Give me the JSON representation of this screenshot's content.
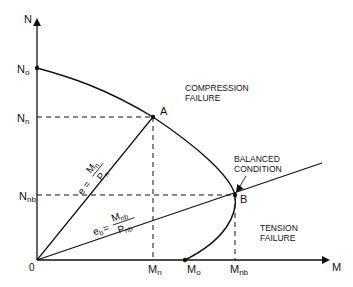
{
  "diagram": {
    "axes": {
      "y_label": "N",
      "x_label": "M",
      "origin_label": "0"
    },
    "y_ticks": {
      "n0": {
        "main": "N",
        "sub": "o"
      },
      "nn": {
        "main": "N",
        "sub": "n"
      },
      "nnb": {
        "main": "N",
        "sub": "nb"
      }
    },
    "x_ticks": {
      "mn": {
        "main": "M",
        "sub": "n"
      },
      "m0": {
        "main": "M",
        "sub": "o"
      },
      "mnb": {
        "main": "M",
        "sub": "nb"
      }
    },
    "points": {
      "a": "A",
      "b": "B"
    },
    "regions": {
      "compression_line1": "COMPRESSION",
      "compression_line2": "FAILURE",
      "tension_line1": "TENSION",
      "tension_line2": "FAILURE",
      "balanced_line1": "BALANCED",
      "balanced_line2": "CONDITION"
    },
    "equations": {
      "e_lhs": "e =",
      "e_num": "M",
      "e_num_sub": "n",
      "e_den": "P",
      "e_den_sub": "n",
      "eb_lhs_main": "e",
      "eb_lhs_sub": "b",
      "eb_eq": "=",
      "eb_num": "M",
      "eb_num_sub": "nb",
      "eb_den": "P",
      "eb_den_sub": "nb"
    },
    "colors": {
      "ink": "#111111",
      "background": "#ffffff"
    }
  }
}
